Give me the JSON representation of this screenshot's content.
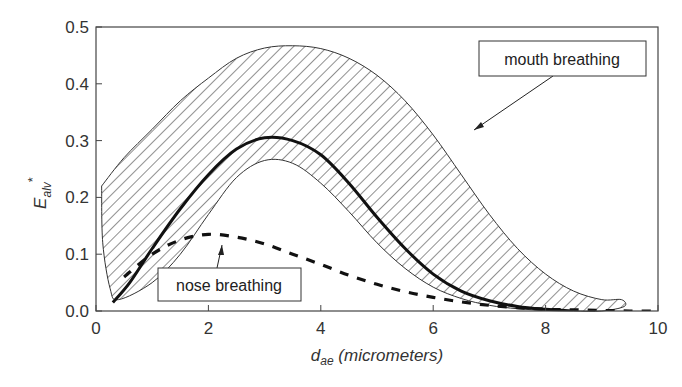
{
  "chart_data": {
    "type": "line",
    "title": "",
    "xlabel": "d_ae (micrometers)",
    "xlabel_main": "d",
    "xlabel_sub": "ae",
    "xlabel_rest": " (micrometers)",
    "ylabel": "E_alv*",
    "ylabel_main": "E",
    "ylabel_sub": "alv",
    "ylabel_sup": "*",
    "xlim": [
      0,
      10
    ],
    "ylim": [
      0,
      0.5
    ],
    "x_ticks": [
      "0",
      "2",
      "4",
      "6",
      "8",
      "10"
    ],
    "y_ticks": [
      "0.0",
      "0.1",
      "0.2",
      "0.3",
      "0.4",
      "0.5"
    ],
    "grid": false,
    "legend": "annotations",
    "series": [
      {
        "name": "mouth breathing (mean)",
        "style": "solid-thick",
        "x": [
          0.3,
          0.6,
          1.0,
          1.5,
          2.0,
          2.5,
          3.0,
          3.5,
          4.0,
          4.5,
          5.0,
          5.5,
          6.0,
          6.5,
          7.0,
          7.5,
          8.0,
          8.5
        ],
        "y": [
          0.015,
          0.05,
          0.11,
          0.18,
          0.24,
          0.285,
          0.305,
          0.3,
          0.275,
          0.225,
          0.165,
          0.11,
          0.065,
          0.035,
          0.018,
          0.008,
          0.003,
          0.0
        ]
      },
      {
        "name": "nose breathing",
        "style": "dashed-thick",
        "x": [
          0.5,
          1.0,
          1.5,
          2.0,
          2.5,
          3.0,
          3.5,
          4.0,
          4.5,
          5.0,
          5.5,
          6.0,
          6.5,
          7.0,
          7.5,
          8.0,
          8.5,
          9.0,
          9.5,
          10.0
        ],
        "y": [
          0.06,
          0.1,
          0.125,
          0.135,
          0.13,
          0.118,
          0.1,
          0.082,
          0.063,
          0.047,
          0.034,
          0.024,
          0.016,
          0.01,
          0.006,
          0.003,
          0.002,
          0.001,
          0.0,
          0.0
        ]
      },
      {
        "name": "mouth breathing range (upper)",
        "style": "thin",
        "x": [
          0.1,
          0.5,
          1.0,
          1.5,
          2.0,
          2.5,
          3.0,
          3.5,
          4.0,
          4.5,
          5.0,
          5.5,
          6.0,
          6.5,
          7.0,
          7.5,
          8.0,
          8.5,
          9.0,
          9.35
        ],
        "y": [
          0.22,
          0.27,
          0.32,
          0.37,
          0.41,
          0.445,
          0.463,
          0.467,
          0.462,
          0.445,
          0.415,
          0.37,
          0.31,
          0.24,
          0.17,
          0.11,
          0.065,
          0.035,
          0.02,
          0.02
        ]
      },
      {
        "name": "mouth breathing range (lower)",
        "style": "thin",
        "x": [
          0.4,
          1.0,
          1.5,
          2.0,
          2.5,
          3.0,
          3.5,
          4.0,
          4.5,
          5.0,
          5.5,
          6.0,
          6.5,
          7.0,
          7.5,
          8.0,
          8.5,
          9.0
        ],
        "y": [
          0.02,
          0.05,
          0.1,
          0.17,
          0.235,
          0.265,
          0.26,
          0.225,
          0.175,
          0.12,
          0.075,
          0.042,
          0.022,
          0.01,
          0.004,
          0.001,
          0.0,
          0.0
        ]
      }
    ],
    "annotations": [
      {
        "text": "mouth breathing",
        "box": true,
        "arrow_to": [
          4.6,
          0.265
        ]
      },
      {
        "text": "nose breathing",
        "box": true,
        "arrow_to": [
          2.2,
          0.125
        ]
      }
    ]
  }
}
